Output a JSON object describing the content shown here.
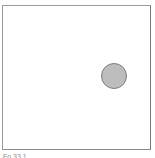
{
  "canvas": {
    "background": "#ffffff",
    "border_color": "#9a9a9a"
  },
  "ball": {
    "fill": "#bdbdbd",
    "stroke": "#7c7c7c"
  },
  "caption": {
    "text": "Fo   33 1"
  }
}
